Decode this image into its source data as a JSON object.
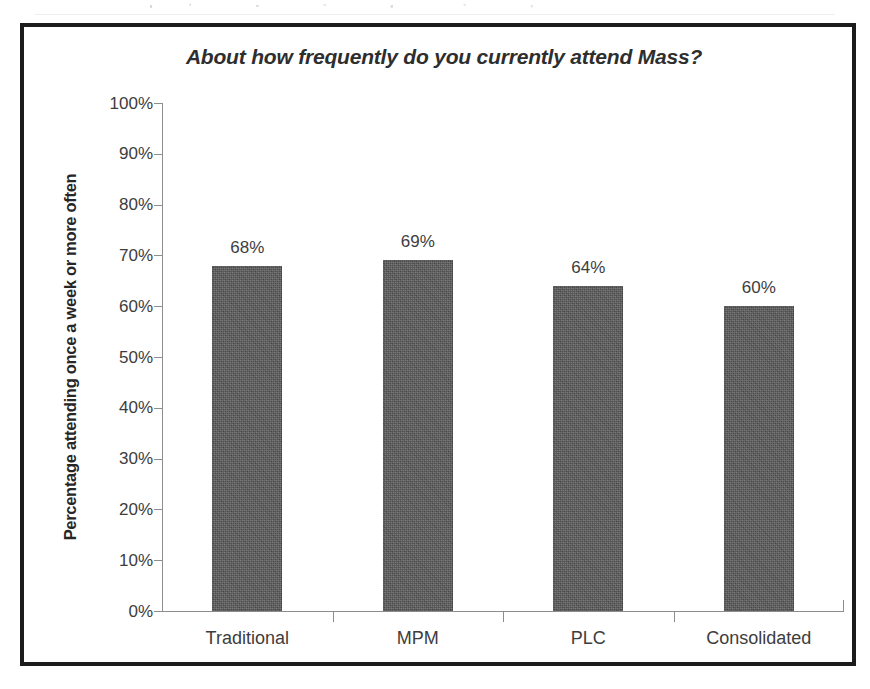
{
  "chart_data": {
    "type": "bar",
    "title": "About how frequently do you currently attend Mass?",
    "xlabel": "",
    "ylabel": "Percentage attending once a week or more often",
    "categories": [
      "Traditional",
      "MPM",
      "PLC",
      "Consolidated"
    ],
    "values": [
      68,
      69,
      64,
      60
    ],
    "value_labels": [
      "68%",
      "69%",
      "64%",
      "60%"
    ],
    "ylim": [
      0,
      100
    ],
    "y_tick_labels": [
      "100%",
      "90%",
      "80%",
      "70%",
      "60%",
      "50%",
      "40%",
      "30%",
      "20%",
      "10%",
      "0%"
    ],
    "y_tick_values": [
      100,
      90,
      80,
      70,
      60,
      50,
      40,
      30,
      20,
      10,
      0
    ],
    "y_tick_suffix": "%",
    "grid": false,
    "legend": false,
    "legend_position": "none",
    "series": [
      {
        "name": "Percentage attending once a week or more often",
        "values": [
          68,
          69,
          64,
          60
        ]
      }
    ],
    "bar_color": "#595959",
    "axis_color": "#8d8d8d",
    "frame_color": "#1c1c1c",
    "text_color": "#3d3d3d",
    "annotations": []
  },
  "frame": {
    "border_color": "#1c1c1c"
  }
}
